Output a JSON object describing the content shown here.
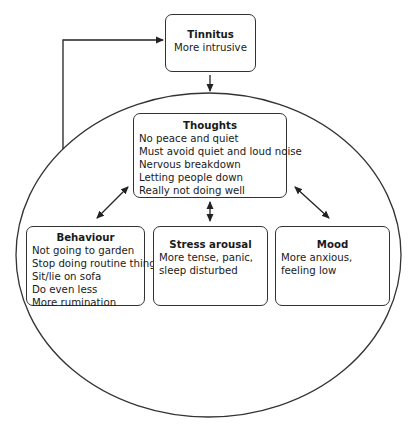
{
  "diagram": {
    "type": "cognitive-behavioural cycle",
    "nodes": {
      "tinnitus": {
        "title": "Tinnitus",
        "lines": [
          "More intrusive"
        ]
      },
      "thoughts": {
        "title": "Thoughts",
        "lines": [
          "No peace and quiet",
          "Must avoid quiet and loud noise",
          "Nervous breakdown",
          "Letting people down",
          "Really not doing well"
        ]
      },
      "behaviour": {
        "title": "Behaviour",
        "lines": [
          "Not going to garden",
          "Stop doing routine things",
          "Sit/lie on sofa",
          "Do even less",
          "More rumination"
        ]
      },
      "stress": {
        "title": "Stress arousal",
        "lines": [
          "More tense, panic,",
          "sleep disturbed"
        ]
      },
      "mood": {
        "title": "Mood",
        "lines": [
          "More anxious,",
          "feeling low"
        ]
      }
    },
    "edges": [
      {
        "from": "tinnitus",
        "to": "cycle",
        "style": "single-arrow"
      },
      {
        "from": "cycle",
        "to": "tinnitus",
        "style": "single-arrow feedback"
      },
      {
        "from": "thoughts",
        "to": "behaviour",
        "style": "double-arrow"
      },
      {
        "from": "thoughts",
        "to": "stress",
        "style": "double-arrow"
      },
      {
        "from": "thoughts",
        "to": "mood",
        "style": "double-arrow"
      }
    ],
    "colors": {
      "stroke": "#333333",
      "background": "#ffffff",
      "text": "#1a1a1a"
    }
  }
}
